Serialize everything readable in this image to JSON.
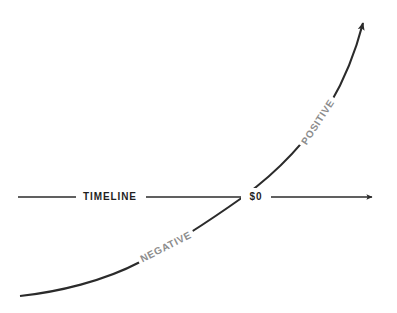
{
  "figure": {
    "type": "diagram",
    "background_color": "#ffffff",
    "line_color": "#2b2b2b",
    "accent_gray": "#8c8c8c"
  },
  "axis": {
    "name": "timeline-axis",
    "label": "TIMELINE",
    "label_color": "#1f1f1f",
    "orientation": "horizontal",
    "y": 197,
    "x_start": 18,
    "x_end": 378,
    "arrowhead": "right",
    "label_x": 110,
    "stroke_width": 1.6
  },
  "origin": {
    "name": "zero-point",
    "label": "$0",
    "label_color": "#1f1f1f",
    "x": 255,
    "y": 197,
    "crossing_x": 243
  },
  "curve": {
    "name": "cash-flow-curve",
    "stroke_width": 2.1,
    "arrowhead": "up-right",
    "start": [
      20,
      296
    ],
    "end": [
      365,
      15
    ],
    "points": [
      [
        20,
        296
      ],
      [
        75,
        288
      ],
      [
        130,
        268
      ],
      [
        180,
        240
      ],
      [
        215,
        218
      ],
      [
        243,
        197
      ],
      [
        280,
        163
      ],
      [
        310,
        130
      ],
      [
        335,
        92
      ],
      [
        352,
        52
      ],
      [
        363,
        22
      ]
    ]
  },
  "curve_labels": [
    {
      "name": "negative-label",
      "text": "NEGATIVE",
      "color": "#8c8c8c",
      "x": 166,
      "y": 247,
      "rotation": -27,
      "knockout_width": 58,
      "knockout_height": 15
    },
    {
      "name": "positive-label",
      "text": "POSITIVE",
      "color": "#8c8c8c",
      "x": 318,
      "y": 122,
      "rotation": -57,
      "knockout_width": 54,
      "knockout_height": 15
    }
  ]
}
